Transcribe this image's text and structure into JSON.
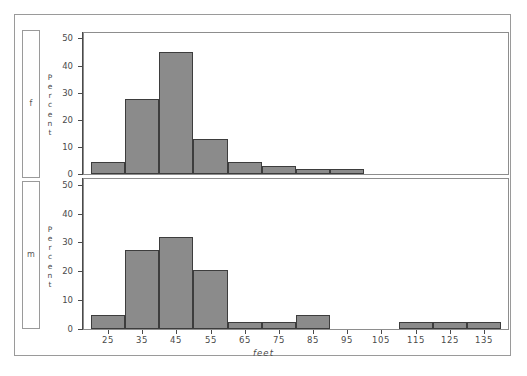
{
  "figure": {
    "title": "",
    "strip_labels": [
      "f",
      "m"
    ],
    "yaxis_title": "Percent",
    "yaxis_letters": [
      "P",
      "e",
      "r",
      "c",
      "e",
      "n",
      "t"
    ],
    "xaxis_title": "feet",
    "bar_fill": "#8b8b8b",
    "bar_edge": "#3d3d3d",
    "frame_color": "#9a9a9a"
  },
  "chart_data": {
    "type": "bar",
    "title": "",
    "subtitle": "",
    "xlabel": "feet",
    "ylabel": "Percent",
    "xlim": [
      18,
      142
    ],
    "ylim": [
      0,
      52
    ],
    "grid": false,
    "legend": "none",
    "layout": "two stacked panels, shared x axis, classification strips on left",
    "xticks": [
      25,
      35,
      45,
      55,
      65,
      75,
      85,
      95,
      105,
      115,
      125,
      135
    ],
    "xticklabels": [
      "25",
      "35",
      "45",
      "55",
      "65",
      "75",
      "85",
      "95",
      "105",
      "115",
      "125",
      "135"
    ],
    "yticks": [
      0,
      10,
      20,
      30,
      40,
      50
    ],
    "yticklabels": [
      "0",
      "10",
      "20",
      "30",
      "40",
      "50"
    ],
    "bin_width": 10,
    "panels": [
      {
        "strip_label": "f",
        "ylabel": "Percent",
        "ylim": [
          0,
          52
        ],
        "bin_centers": [
          25,
          35,
          45,
          55,
          65,
          75,
          85,
          95,
          105,
          115,
          125,
          135
        ],
        "values": [
          4.5,
          27.5,
          45.0,
          13.0,
          4.5,
          3.0,
          1.8,
          1.8,
          0,
          0,
          0,
          0
        ]
      },
      {
        "strip_label": "m",
        "ylabel": "Percent",
        "ylim": [
          0,
          52
        ],
        "bin_centers": [
          25,
          35,
          45,
          55,
          65,
          75,
          85,
          95,
          105,
          115,
          125,
          135
        ],
        "values": [
          4.8,
          27.5,
          32.0,
          20.5,
          2.5,
          2.5,
          5.0,
          0,
          0,
          2.5,
          2.5,
          2.5
        ]
      }
    ]
  }
}
